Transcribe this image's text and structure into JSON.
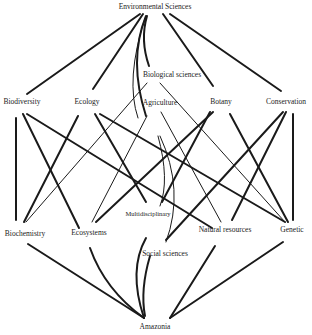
{
  "diagram": {
    "type": "network",
    "nodes": {
      "environmental_sciences": "Environmental Sciences",
      "biological_sciences": "Biological sciences",
      "biodiversity": "Biodiversity",
      "ecology": "Ecology",
      "agriculture": "Agriculture",
      "botany": "Botany",
      "conservation": "Conservation",
      "biochemistry": "Biochemistry",
      "ecosystems": "Ecosystems",
      "multidisciplinary": "Multidisciplinary",
      "natural_resources": "Natural resources",
      "genetic": "Genetic",
      "social_sciences": "Social sciences",
      "amazonia": "Amazonia"
    },
    "edges": [
      [
        "Environmental Sciences",
        "Biodiversity"
      ],
      [
        "Environmental Sciences",
        "Ecology"
      ],
      [
        "Environmental Sciences",
        "Biological sciences"
      ],
      [
        "Environmental Sciences",
        "Agriculture"
      ],
      [
        "Environmental Sciences",
        "Botany"
      ],
      [
        "Environmental Sciences",
        "Conservation"
      ],
      [
        "Environmental Sciences",
        "Multidisciplinary"
      ],
      [
        "Biodiversity",
        "Biochemistry"
      ],
      [
        "Biodiversity",
        "Ecosystems"
      ],
      [
        "Biodiversity",
        "Natural resources"
      ],
      [
        "Ecology",
        "Biochemistry"
      ],
      [
        "Ecology",
        "Multidisciplinary"
      ],
      [
        "Ecology",
        "Genetic"
      ],
      [
        "Biological sciences",
        "Biochemistry"
      ],
      [
        "Biological sciences",
        "Genetic"
      ],
      [
        "Agriculture",
        "Ecosystems"
      ],
      [
        "Agriculture",
        "Natural resources"
      ],
      [
        "Agriculture",
        "Social sciences"
      ],
      [
        "Botany",
        "Ecosystems"
      ],
      [
        "Botany",
        "Multidisciplinary"
      ],
      [
        "Botany",
        "Genetic"
      ],
      [
        "Conservation",
        "Social sciences"
      ],
      [
        "Conservation",
        "Natural resources"
      ],
      [
        "Conservation",
        "Genetic"
      ],
      [
        "Biochemistry",
        "Amazonia"
      ],
      [
        "Ecosystems",
        "Amazonia"
      ],
      [
        "Multidisciplinary",
        "Amazonia"
      ],
      [
        "Social sciences",
        "Amazonia"
      ],
      [
        "Natural resources",
        "Amazonia"
      ],
      [
        "Genetic",
        "Amazonia"
      ]
    ]
  }
}
